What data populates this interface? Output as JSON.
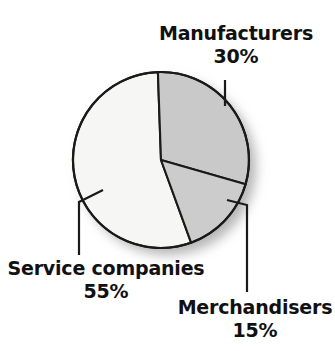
{
  "chart_data": {
    "type": "pie",
    "title": "",
    "subtitle": "",
    "xlabel": "",
    "ylabel": "",
    "legend_position": "none",
    "grid": false,
    "labels_inline": true,
    "unit": "%",
    "total": 100,
    "categories": [
      "Manufacturers",
      "Merchandisers",
      "Service companies"
    ],
    "values": [
      30,
      15,
      55
    ],
    "slices": [
      {
        "name": "Manufacturers",
        "label": "Manufacturers",
        "value": 30,
        "value_text": "30%",
        "color": "#c9c9c9",
        "start_angle_deg": 0,
        "end_angle_deg": 108
      },
      {
        "name": "Merchandisers",
        "label": "Merchandisers",
        "value": 15,
        "value_text": "15%",
        "color": "#cccccc",
        "start_angle_deg": 108,
        "end_angle_deg": 162
      },
      {
        "name": "Service companies",
        "label": "Service companies",
        "value": 55,
        "value_text": "55%",
        "color": "#f6f6f4",
        "start_angle_deg": 162,
        "end_angle_deg": 360
      }
    ]
  },
  "labels": {
    "manufacturers": {
      "name": "Manufacturers",
      "percent": "30%"
    },
    "merchandisers": {
      "name": "Merchandisers",
      "percent": "15%"
    },
    "service": {
      "name": "Service companies",
      "percent": "55%"
    }
  },
  "style": {
    "background": "#ffffff",
    "stroke": "#1a1a1a",
    "text": "#111111",
    "slice_manufacturers": "#c9c9c9",
    "slice_merchandisers": "#cccccc",
    "slice_service": "#f6f6f4",
    "shadow": "#bdbdbd"
  },
  "geometry": {
    "center_x": 161,
    "center_y": 160,
    "radius": 88
  }
}
